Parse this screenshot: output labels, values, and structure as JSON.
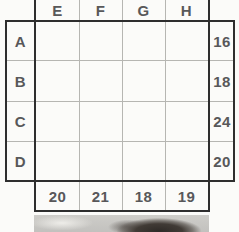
{
  "puzzle": {
    "col_headers": [
      "E",
      "F",
      "G",
      "H"
    ],
    "row_headers": [
      "A",
      "B",
      "C",
      "D"
    ],
    "row_totals": [
      "16",
      "18",
      "24",
      "20"
    ],
    "col_totals": [
      "20",
      "21",
      "18",
      "19"
    ]
  },
  "photo": {
    "name": "partial-photo-top-of-head"
  },
  "colors": {
    "background": "#fbfbf9",
    "border_dark": "#2e2e2e",
    "grid_line_light": "#b6b6b2",
    "label_text": "#58585a"
  }
}
